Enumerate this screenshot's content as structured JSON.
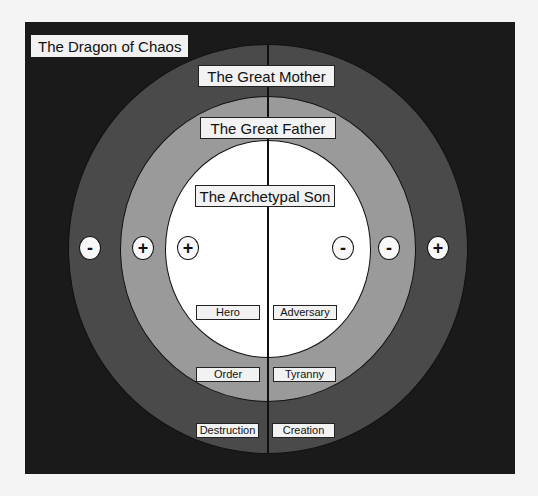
{
  "diagram": {
    "outer_region": {
      "label": "The Dragon of Chaos",
      "color": "#1a1a1a"
    },
    "rings": [
      {
        "name": "outer",
        "label": "The Great Mother",
        "color": "#4a4a4a"
      },
      {
        "name": "middle",
        "label": "The Great Father",
        "color": "#9a9a9a"
      },
      {
        "name": "inner",
        "label": "The Archetypal Son",
        "color": "#ffffff"
      }
    ],
    "signs": {
      "left": [
        "-",
        "+",
        "+"
      ],
      "right": [
        "-",
        "-",
        "+"
      ]
    },
    "pairs": {
      "inner": {
        "left": "Hero",
        "right": "Adversary"
      },
      "middle": {
        "left": "Order",
        "right": "Tyranny"
      },
      "outer": {
        "left": "Destruction",
        "right": "Creation"
      }
    }
  }
}
